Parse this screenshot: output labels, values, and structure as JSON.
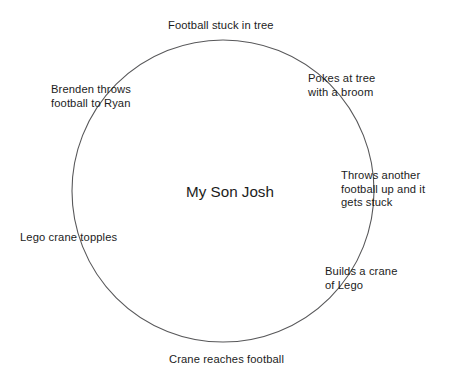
{
  "diagram": {
    "type": "cycle-diagram",
    "center": {
      "label": "My Son Josh"
    },
    "circle": {
      "stroke_color": "#58585a",
      "fill": "none",
      "center_x": 223,
      "center_y": 191,
      "radius": 151
    },
    "background_color": "#ffffff",
    "text_color": "#1c1c1c",
    "nodes": [
      {
        "id": "football-stuck-in-tree",
        "label": "Football stuck in tree",
        "position": "top"
      },
      {
        "id": "pokes-at-tree",
        "label": "Pokes at tree\nwith a broom",
        "position": "upper-right"
      },
      {
        "id": "throws-another-football",
        "label": "Throws another\nfootball up and it\ngets stuck",
        "position": "right"
      },
      {
        "id": "builds-a-crane",
        "label": "Builds a crane\nof Lego",
        "position": "lower-right"
      },
      {
        "id": "crane-reaches-football",
        "label": "Crane reaches football",
        "position": "bottom"
      },
      {
        "id": "lego-crane-topples",
        "label": "Lego crane topples",
        "position": "left"
      },
      {
        "id": "brenden-throws-football",
        "label": "Brenden throws\nfootball to Ryan",
        "position": "upper-left"
      }
    ]
  }
}
